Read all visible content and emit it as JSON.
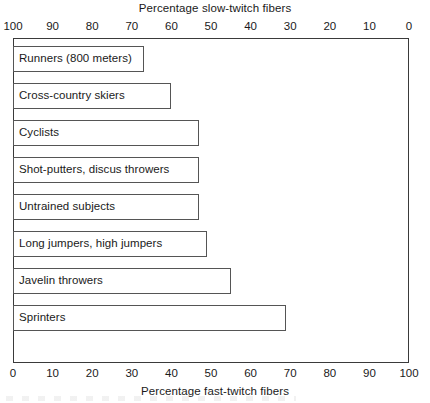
{
  "chart_data": {
    "type": "bar",
    "orientation": "horizontal",
    "title": "",
    "xlabel": "Percentage fast-twitch fibers",
    "xlabel_secondary": "Percentage slow-twitch fibers",
    "ylabel": "",
    "xlim": [
      0,
      100
    ],
    "xlim_secondary": [
      100,
      0
    ],
    "grid": false,
    "legend": null,
    "axis_bottom": {
      "label": "Percentage fast-twitch fibers",
      "ticks": [
        0,
        10,
        20,
        30,
        40,
        50,
        60,
        70,
        80,
        90,
        100
      ],
      "tick_labels": [
        "0",
        "10",
        "20",
        "30",
        "40",
        "50",
        "60",
        "70",
        "80",
        "90",
        "100"
      ],
      "direction": "left-to-right"
    },
    "axis_top": {
      "label": "Percentage slow-twitch fibers",
      "ticks": [
        100,
        90,
        80,
        70,
        60,
        50,
        40,
        30,
        20,
        10,
        0
      ],
      "tick_labels": [
        "100",
        "90",
        "80",
        "70",
        "60",
        "50",
        "40",
        "30",
        "20",
        "10",
        "0"
      ],
      "direction": "right-to-left"
    },
    "categories": [
      "Runners (800 meters)",
      "Cross-country skiers",
      "Cyclists",
      "Shot-putters, discus throwers",
      "Untrained subjects",
      "Long jumpers, high jumpers",
      "Javelin throwers",
      "Sprinters"
    ],
    "series": [
      {
        "name": "Percentage fast-twitch fibers",
        "values": [
          33,
          40,
          47,
          47,
          47,
          49,
          55,
          69
        ]
      },
      {
        "name": "Percentage slow-twitch fibers",
        "values": [
          67,
          60,
          53,
          53,
          53,
          51,
          45,
          31
        ]
      }
    ],
    "bars": [
      {
        "label": "Runners (800 meters)",
        "fast_twitch": 33,
        "slow_twitch": 67
      },
      {
        "label": "Cross-country skiers",
        "fast_twitch": 40,
        "slow_twitch": 60
      },
      {
        "label": "Cyclists",
        "fast_twitch": 47,
        "slow_twitch": 53
      },
      {
        "label": "Shot-putters, discus throwers",
        "fast_twitch": 47,
        "slow_twitch": 53
      },
      {
        "label": "Untrained subjects",
        "fast_twitch": 47,
        "slow_twitch": 53
      },
      {
        "label": "Long jumpers, high jumpers",
        "fast_twitch": 49,
        "slow_twitch": 51
      },
      {
        "label": "Javelin throwers",
        "fast_twitch": 55,
        "slow_twitch": 45
      },
      {
        "label": "Sprinters",
        "fast_twitch": 69,
        "slow_twitch": 31
      }
    ],
    "colors": {
      "bar_fill": "#ffffff",
      "bar_border": "#555555",
      "frame": "#3a3a3a",
      "text": "#1a1a1a",
      "background": "#ffffff"
    }
  }
}
